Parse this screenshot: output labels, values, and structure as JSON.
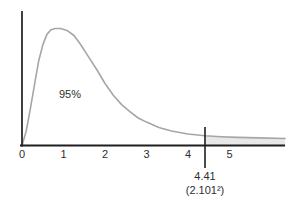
{
  "figure": {
    "background_color": "#ffffff"
  },
  "chart_data": {
    "type": "area",
    "title": "",
    "xlabel": "",
    "ylabel": "",
    "x_ticks": [
      0,
      1,
      2,
      3,
      4,
      5
    ],
    "xlim": [
      0,
      6.34
    ],
    "grid": false,
    "legend": false,
    "area_label": "95%",
    "critical_value": 4.41,
    "critical_value_label": "4.41",
    "critical_value_sub_label": "(2.101²)",
    "shaded_region": "tail where x > 4.41",
    "colors": {
      "curve": "#a6a6a6",
      "axis": "#1f1f1f",
      "shade": "#e8e8e8",
      "text": "#2e2e2e"
    },
    "curve_points": [
      [
        0,
        0
      ],
      [
        0.1,
        0.12
      ],
      [
        0.2,
        0.31
      ],
      [
        0.3,
        0.52
      ],
      [
        0.4,
        0.72
      ],
      [
        0.5,
        0.86
      ],
      [
        0.6,
        0.95
      ],
      [
        0.7,
        0.99
      ],
      [
        0.8,
        1.0
      ],
      [
        0.93,
        1.0
      ],
      [
        1.1,
        0.98
      ],
      [
        1.25,
        0.94
      ],
      [
        1.4,
        0.87
      ],
      [
        1.6,
        0.76
      ],
      [
        1.8,
        0.65
      ],
      [
        2.0,
        0.53
      ],
      [
        2.2,
        0.43
      ],
      [
        2.4,
        0.35
      ],
      [
        2.6,
        0.29
      ],
      [
        2.8,
        0.235
      ],
      [
        3.0,
        0.2
      ],
      [
        3.3,
        0.154
      ],
      [
        3.6,
        0.124
      ],
      [
        4.0,
        0.098
      ],
      [
        4.41,
        0.084
      ],
      [
        4.8,
        0.075
      ],
      [
        5.2,
        0.069
      ],
      [
        5.7,
        0.065
      ],
      [
        6.34,
        0.06
      ]
    ]
  }
}
